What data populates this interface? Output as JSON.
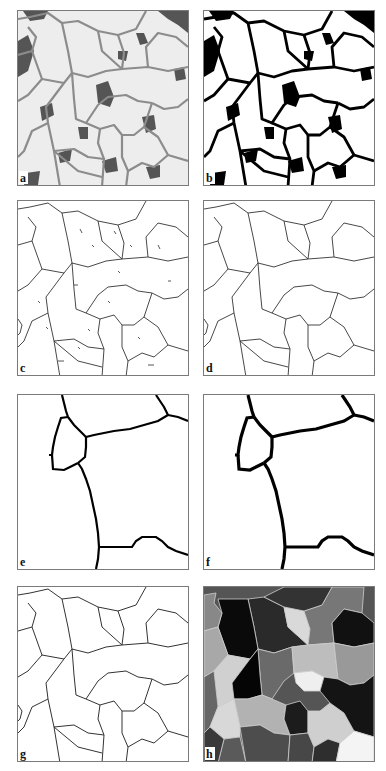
{
  "figure": {
    "panels": [
      {
        "id": "a",
        "label": "a",
        "description": "original grayscale micrograph of grain structure"
      },
      {
        "id": "b",
        "label": "b",
        "description": "binarized (thresholded) image"
      },
      {
        "id": "c",
        "label": "c",
        "description": "skeletonized grain boundaries with spurious fragments"
      },
      {
        "id": "d",
        "label": "d",
        "description": "cleaned skeleton of grain boundaries"
      },
      {
        "id": "e",
        "label": "e",
        "description": "magnified detail of skeleton, pixel-wide boundaries"
      },
      {
        "id": "f",
        "label": "f",
        "description": "magnified detail after boundary thickening"
      },
      {
        "id": "g",
        "label": "g",
        "description": "final grain boundary network"
      },
      {
        "id": "h",
        "label": "h",
        "description": "labeled grains shown in gray levels"
      }
    ],
    "colors": {
      "background": "#ffffff",
      "frame": "#7a7a7a",
      "boundary_line": "#333333",
      "grain_light": "#eeeeee",
      "boundary_gray": "#8c8c8c",
      "binary_black": "#000000"
    }
  }
}
